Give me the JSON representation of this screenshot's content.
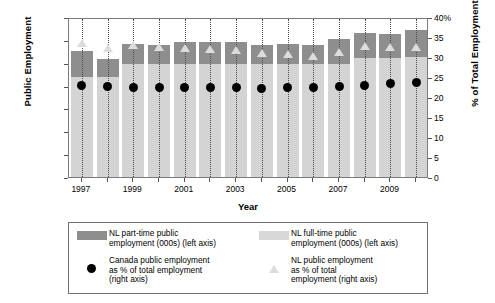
{
  "chart_data": {
    "type": "bar",
    "title": "",
    "xlabel": "Year",
    "ylabel": "Public Employment",
    "ylabel_right": "% of Total Employment",
    "grid": true,
    "legend_position": "bottom",
    "categories": [
      "1997",
      "1998",
      "1999",
      "2000",
      "2001",
      "2002",
      "2003",
      "2004",
      "2005",
      "2006",
      "2007",
      "2008",
      "2009",
      "2010"
    ],
    "xtick_labels": [
      "1997",
      "",
      "1999",
      "",
      "2001",
      "",
      "2003",
      "",
      "2005",
      "",
      "2007",
      "",
      "2009",
      ""
    ],
    "ylim": [
      0,
      70000
    ],
    "yticks": [
      "0",
      "10,000",
      "20,000",
      "30,000",
      "40,000",
      "50,000",
      "60,000",
      "70,000"
    ],
    "ylim_right": [
      0,
      40
    ],
    "yticks_right": [
      "0",
      "5",
      "10",
      "15",
      "20",
      "25",
      "30",
      "35",
      "40%"
    ],
    "series": [
      {
        "name": "NL full-time public employment (000s) (left axis)",
        "axis": "left",
        "type": "bar-stacked",
        "color": "#d4d4d4",
        "values": [
          44600,
          44600,
          50500,
          50500,
          50500,
          50500,
          50500,
          50500,
          50500,
          50500,
          50500,
          53000,
          53000,
          53500
        ]
      },
      {
        "name": "NL part-time public employment (000s) (left axis)",
        "axis": "left",
        "type": "bar-stacked",
        "color": "#8e8e8e",
        "values": [
          11400,
          8100,
          8700,
          8000,
          9300,
          9300,
          9300,
          8000,
          8700,
          8000,
          10700,
          11000,
          10300,
          11500
        ]
      },
      {
        "name": "Canada public employment as % of total employment (right axis)",
        "axis": "right",
        "type": "scatter-circle",
        "color": "#000000",
        "values": [
          23.4,
          23.1,
          23.0,
          23.0,
          22.9,
          22.8,
          22.8,
          22.7,
          22.9,
          23.0,
          23.2,
          23.5,
          23.8,
          24.2
        ]
      },
      {
        "name": "NL public employment as % of total employment (right axis)",
        "axis": "right",
        "type": "scatter-triangle",
        "color": "#dcdcdc",
        "values": [
          34.0,
          32.7,
          33.5,
          33.0,
          32.8,
          32.6,
          32.3,
          31.4,
          31.2,
          30.7,
          31.8,
          33.2,
          33.0,
          33.0
        ]
      }
    ]
  },
  "axes": {
    "left_title": "Public Employment",
    "right_title": "% of Total Employment",
    "x_title": "Year"
  },
  "legend": {
    "items": [
      {
        "key": "swatch-dark",
        "lines": [
          "NL part-time public",
          "employment (000s) (left axis)"
        ]
      },
      {
        "key": "swatch-light",
        "lines": [
          "NL full-time public",
          "employment (000s) (left axis)"
        ]
      },
      {
        "key": "dot",
        "lines": [
          "Canada public employment",
          "as % of total employment",
          "(right axis)"
        ]
      },
      {
        "key": "triangle",
        "lines": [
          "NL public employment",
          "as % of total",
          "employment (right axis)"
        ]
      }
    ]
  }
}
